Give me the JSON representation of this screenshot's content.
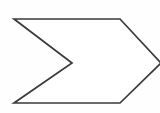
{
  "canvas": {
    "width": 160,
    "height": 113,
    "background_color": "#fefefe",
    "label": "chevron-arrow-diagram"
  },
  "shape": {
    "name": "chevron-arrow",
    "description": "Open chevron / arrow outline pointing right with a V-notch on the left side",
    "stroke_color": "#3a3a3a",
    "fill_color": "#ffffff",
    "stroke_width": 1.7,
    "closed": true,
    "clipped_at_right_edge": true,
    "points": [
      {
        "name": "top-left-corner",
        "x": 14,
        "y": 19
      },
      {
        "name": "top-right-shoulder",
        "x": 120,
        "y": 19
      },
      {
        "name": "right-tip",
        "x": 161,
        "y": 63
      },
      {
        "name": "bottom-right-shoulder",
        "x": 120,
        "y": 103
      },
      {
        "name": "bottom-left-corner",
        "x": 14,
        "y": 103
      },
      {
        "name": "notch-tip",
        "x": 72,
        "y": 63
      }
    ],
    "path": "M 14 19 L 120 19 L 161 63 L 120 103 L 14 103 L 72 63 Z"
  }
}
